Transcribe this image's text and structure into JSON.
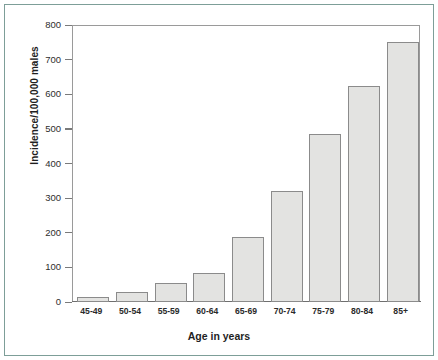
{
  "figure": {
    "background_color": "#ffffff",
    "frame_color": "#7d9e98",
    "axis_color": "#6f6f6f"
  },
  "chart_data": {
    "type": "bar",
    "title": "",
    "xlabel": "Age in years",
    "ylabel": "Incidence/100,000 males",
    "categories": [
      "45-49",
      "50-54",
      "55-59",
      "60-64",
      "65-69",
      "70-74",
      "75-79",
      "80-84",
      "85+"
    ],
    "values": [
      14,
      29,
      56,
      85,
      188,
      320,
      485,
      625,
      752
    ],
    "ylim": [
      0,
      800
    ],
    "yticks": [
      0,
      100,
      200,
      300,
      400,
      500,
      600,
      700,
      800
    ],
    "ytick_labels": [
      "0",
      "100",
      "200",
      "300",
      "400",
      "500",
      "600",
      "700",
      "800"
    ],
    "grid": false,
    "legend": null,
    "bar_fill_color": "#e3e3e1",
    "bar_edge_color": "#8b8b8b"
  }
}
